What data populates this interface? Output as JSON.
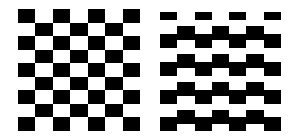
{
  "image": {
    "width": 296,
    "height": 138,
    "background": "#ffffff",
    "ink": "#000000"
  },
  "figures": [
    {
      "name": "regular-checkerboard",
      "label": "Regular checkerboard",
      "left": 18,
      "top": 9,
      "width": 122,
      "height": 122,
      "columns": 7,
      "rows": 9,
      "first_cell_black": true
    },
    {
      "name": "staggered-checkerboard",
      "label": "Staggered (illusion) checkerboard",
      "left": 160,
      "top": 12,
      "width": 121,
      "height": 119,
      "columns": 7,
      "column_patterns": {
        "even": [
          [
            0,
            8
          ],
          [
            22,
            36
          ],
          [
            50,
            64
          ],
          [
            78,
            92
          ],
          [
            105,
            119
          ]
        ],
        "odd": [
          [
            14,
            28
          ],
          [
            42,
            56
          ],
          [
            70,
            84
          ],
          [
            98,
            112
          ]
        ]
      }
    }
  ]
}
